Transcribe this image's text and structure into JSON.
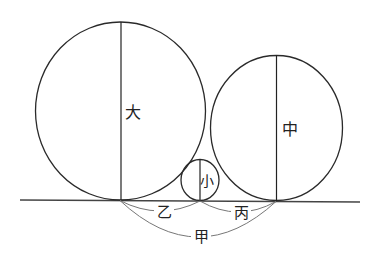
{
  "diagram": {
    "title": "",
    "colors": {
      "stroke": "#2a2a2a",
      "arc": "#777777",
      "background": "#ffffff"
    },
    "ground": {
      "x1": 20,
      "y1": 200,
      "x2": 360,
      "y2": 202
    },
    "circles": [
      {
        "id": "large",
        "label": "大",
        "cx": 120.5,
        "cy": 111,
        "rx": 85,
        "ry": 89,
        "diameter_line": {
          "x": 121,
          "y1": 22,
          "y2": 200
        },
        "label_pos": {
          "x": 133,
          "y": 118
        }
      },
      {
        "id": "medium",
        "label": "中",
        "cx": 276.5,
        "cy": 128,
        "rx": 66,
        "ry": 72.5,
        "diameter_line": {
          "x": 276.5,
          "y1": 55,
          "y2": 201
        },
        "label_pos": {
          "x": 290,
          "y": 135
        }
      },
      {
        "id": "small",
        "label": "小",
        "cx": 200,
        "cy": 180,
        "rx": 19,
        "ry": 20.5,
        "diameter_line": {
          "x": 200,
          "y1": 159.5,
          "y2": 201
        },
        "label_pos": {
          "x": 207,
          "y": 186
        }
      }
    ],
    "distances": [
      {
        "id": "yi",
        "label": "乙",
        "from_x": 120,
        "to_x": 200,
        "sag_y": 211,
        "label_pos": {
          "x": 164,
          "y": 217
        }
      },
      {
        "id": "bing",
        "label": "丙",
        "from_x": 200,
        "to_x": 276,
        "sag_y": 212,
        "label_pos": {
          "x": 241,
          "y": 218
        }
      },
      {
        "id": "jia",
        "label": "甲",
        "from_x": 120,
        "to_x": 276,
        "sag_y": 237,
        "label_pos": {
          "x": 201,
          "y": 242
        }
      }
    ]
  }
}
